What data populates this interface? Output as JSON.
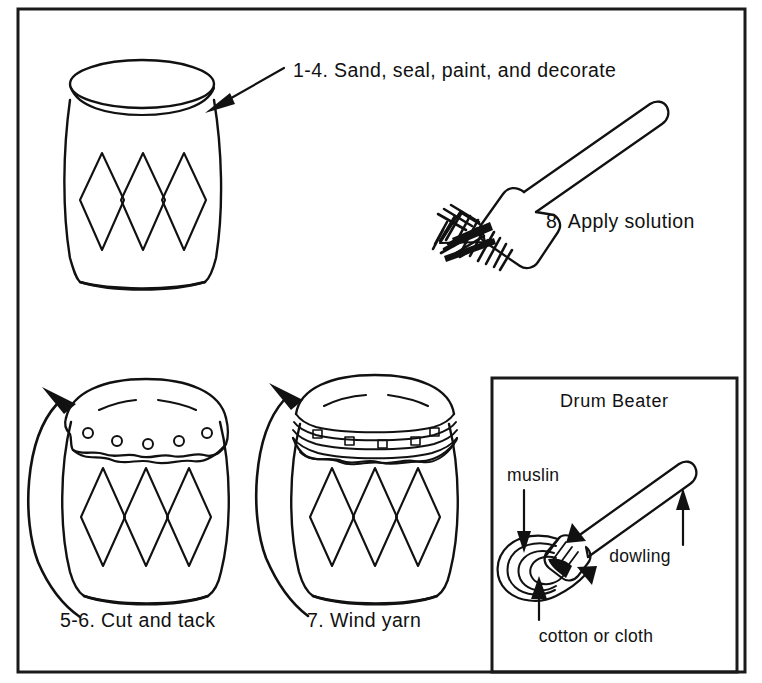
{
  "figure": {
    "background_color": "#ffffff",
    "ink_color": "#111111",
    "border_color": "#1a1a1a"
  },
  "steps": {
    "step_1_4": {
      "label": "1-4. Sand, seal, paint, and decorate",
      "illustration": "plain-decorated-drum",
      "annotation": "arrow-pointing-to-drum"
    },
    "step_8": {
      "label": "8. Apply solution",
      "illustration": "paintbrush"
    },
    "step_5_6": {
      "label": "5-6. Cut and tack",
      "illustration": "drum-with-tacked-head",
      "annotation": "curved-arrow-around-drum"
    },
    "step_7": {
      "label": "7. Wind yarn",
      "illustration": "drum-with-yarn-wound-head",
      "annotation": "curved-arrow-around-drum"
    }
  },
  "inset": {
    "title": "Drum Beater",
    "labels": {
      "muslin": "muslin",
      "dowling": "dowling",
      "cotton_or_cloth": "cotton or cloth"
    }
  }
}
